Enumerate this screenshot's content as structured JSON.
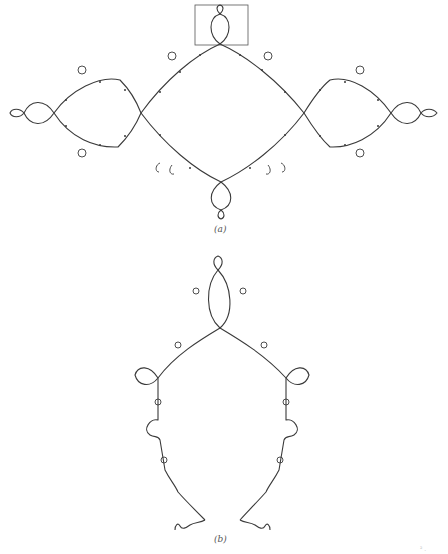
{
  "figure": {
    "panel_a": {
      "label": "(a)",
      "description": "Julia set curve with four loops along a horizontal axis and an inset box marking a zoomed region at top",
      "inset_box": {
        "x": 195,
        "y": 5,
        "w": 53,
        "h": 40
      }
    },
    "panel_b": {
      "label": "(b)",
      "description": "Magnified view of the boxed region in (a), showing self-similar structure"
    },
    "stroke_color": "#3a3a3a",
    "footer_fragment": "² ."
  }
}
